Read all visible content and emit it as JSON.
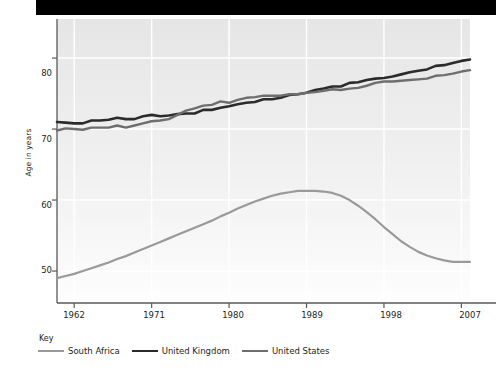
{
  "figure": {
    "background_color": "#ffffff",
    "banner_color": "#000000",
    "plot_background_color": "#e6e6e6",
    "gridline_color": "#ffffff",
    "axis_color": "#58595b"
  },
  "axes": {
    "y_title": "Age in years",
    "y_ticks": [
      "50",
      "60",
      "70",
      "80"
    ],
    "x_ticks": [
      "1962",
      "1971",
      "1980",
      "1989",
      "1998",
      "2007"
    ]
  },
  "legend": {
    "title": "Key",
    "items": [
      {
        "label": "South Africa",
        "color": "#9a9a9a"
      },
      {
        "label": "United Kingdom",
        "color": "#2b2b2b"
      },
      {
        "label": "United States",
        "color": "#6e6e6e"
      }
    ]
  },
  "chart_data": {
    "type": "line",
    "title": "",
    "xlabel": "",
    "ylabel": "Age in years",
    "xlim": [
      1960,
      2008
    ],
    "ylim": [
      45.5,
      85.5
    ],
    "xticks": [
      1962,
      1971,
      1980,
      1989,
      1998,
      2007
    ],
    "yticks": [
      50,
      60,
      70,
      80
    ],
    "grid": "vertical-and-horizontal-white",
    "legend_position": "below-plot-left",
    "x": [
      1960,
      1961,
      1962,
      1963,
      1964,
      1965,
      1966,
      1967,
      1968,
      1969,
      1970,
      1971,
      1972,
      1973,
      1974,
      1975,
      1976,
      1977,
      1978,
      1979,
      1980,
      1981,
      1982,
      1983,
      1984,
      1985,
      1986,
      1987,
      1988,
      1989,
      1990,
      1991,
      1992,
      1993,
      1994,
      1995,
      1996,
      1997,
      1998,
      1999,
      2000,
      2001,
      2002,
      2003,
      2004,
      2005,
      2006,
      2007,
      2008
    ],
    "series": [
      {
        "name": "South Africa",
        "color": "#9a9a9a",
        "width": 2.2,
        "values": [
          49.0,
          49.3,
          49.6,
          50.0,
          50.4,
          50.8,
          51.2,
          51.7,
          52.1,
          52.6,
          53.1,
          53.6,
          54.1,
          54.6,
          55.1,
          55.6,
          56.1,
          56.6,
          57.1,
          57.7,
          58.2,
          58.8,
          59.3,
          59.8,
          60.2,
          60.6,
          60.9,
          61.1,
          61.3,
          61.3,
          61.3,
          61.2,
          61.0,
          60.6,
          60.0,
          59.2,
          58.3,
          57.3,
          56.2,
          55.2,
          54.2,
          53.4,
          52.7,
          52.2,
          51.8,
          51.5,
          51.3,
          51.3,
          51.3
        ]
      },
      {
        "name": "United Kingdom",
        "color": "#2b2b2b",
        "width": 2.6,
        "values": [
          71.0,
          70.9,
          70.8,
          70.8,
          71.2,
          71.2,
          71.3,
          71.6,
          71.4,
          71.4,
          71.8,
          72.0,
          71.8,
          71.9,
          72.1,
          72.2,
          72.2,
          72.7,
          72.7,
          73.0,
          73.2,
          73.5,
          73.7,
          73.8,
          74.2,
          74.2,
          74.4,
          74.8,
          74.9,
          75.1,
          75.5,
          75.7,
          76.0,
          76.0,
          76.5,
          76.6,
          76.9,
          77.1,
          77.2,
          77.4,
          77.7,
          78.0,
          78.2,
          78.4,
          78.9,
          79.0,
          79.3,
          79.6,
          79.8
        ]
      },
      {
        "name": "United States",
        "color": "#6e6e6e",
        "width": 2.4,
        "values": [
          69.8,
          70.1,
          70.0,
          69.9,
          70.2,
          70.2,
          70.2,
          70.5,
          70.2,
          70.5,
          70.8,
          71.1,
          71.2,
          71.4,
          72.0,
          72.6,
          72.9,
          73.3,
          73.4,
          73.9,
          73.7,
          74.1,
          74.4,
          74.5,
          74.7,
          74.7,
          74.7,
          74.9,
          74.9,
          75.1,
          75.2,
          75.4,
          75.6,
          75.5,
          75.7,
          75.8,
          76.1,
          76.5,
          76.7,
          76.7,
          76.8,
          76.9,
          77.0,
          77.1,
          77.5,
          77.6,
          77.8,
          78.1,
          78.3
        ]
      }
    ]
  }
}
